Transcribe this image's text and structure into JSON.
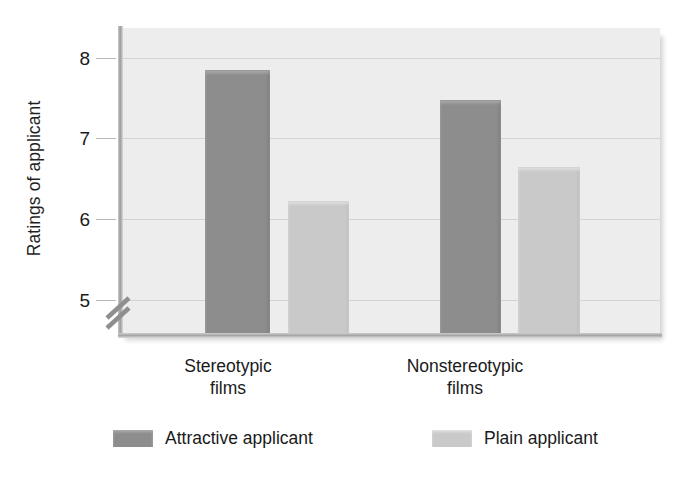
{
  "chart_data": {
    "type": "bar",
    "title": "",
    "subtitle": "",
    "xlabel": "",
    "ylabel": "Ratings of applicant",
    "ylim": [
      4.55,
      8.37
    ],
    "yticks": [
      5,
      6,
      7,
      8
    ],
    "ytick_labels": [
      "5",
      "6",
      "7",
      "8"
    ],
    "y_axis_broken": true,
    "grid": true,
    "grid_axis": "y",
    "legend_position": "bottom",
    "categories": [
      "Stereotypic films",
      "Nonstereotypic films"
    ],
    "category_lines": [
      [
        "Stereotypic",
        "films"
      ],
      [
        "Nonstereotypic",
        "films"
      ]
    ],
    "series": [
      {
        "name": "Attractive applicant",
        "color": "#8d8d8d",
        "values": [
          7.84,
          7.47
        ]
      },
      {
        "name": "Plain applicant",
        "color": "#c9c9c9",
        "values": [
          6.21,
          6.63
        ]
      }
    ]
  },
  "axis": {
    "y_title": "Ratings of applicant",
    "ticks": [
      {
        "label": "8",
        "value": 8
      },
      {
        "label": "7",
        "value": 7
      },
      {
        "label": "6",
        "value": 6
      },
      {
        "label": "5",
        "value": 5
      }
    ],
    "break_symbol": "double-slash"
  },
  "categories": [
    {
      "line1": "Stereotypic",
      "line2": "films"
    },
    {
      "line1": "Nonstereotypic",
      "line2": "films"
    }
  ],
  "legend": {
    "items": [
      {
        "label": "Attractive applicant",
        "color": "#8d8d8d"
      },
      {
        "label": "Plain applicant",
        "color": "#c9c9c9"
      }
    ]
  },
  "colors": {
    "plot_background": "#ededed",
    "gridline": "#d3d3d3",
    "axis": "#a6a6a6",
    "bar_dark": "#8d8d8d",
    "bar_light": "#c9c9c9",
    "text": "#1a1a1a",
    "page_background": "#ffffff"
  }
}
